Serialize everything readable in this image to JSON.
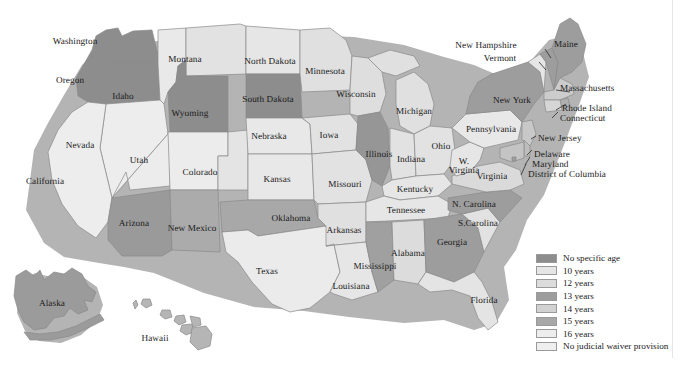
{
  "figure": {
    "type": "choropleth-map",
    "caption_partial": ""
  },
  "palette": {
    "no_specific_age": "#8d8d8d",
    "ten_years": "#e6e6e6",
    "twelve_years": "#dcdcdc",
    "thirteen_years": "#9d9d9d",
    "fourteen_years": "#d2d2d2",
    "fifteen_years": "#a8a8a8",
    "sixteen_years": "#ededed",
    "no_provision": "#efefef",
    "border": "#8a8a8a",
    "text": "#1a1a1a",
    "background": "#ffffff",
    "shadow": "#9b9b9b"
  },
  "legend": {
    "items": [
      {
        "label": "No specific age",
        "color": "#8d8d8d"
      },
      {
        "label": "10 years",
        "color": "#e6e6e6"
      },
      {
        "label": "12 years",
        "color": "#dcdcdc"
      },
      {
        "label": "13 years",
        "color": "#9d9d9d"
      },
      {
        "label": "14 years",
        "color": "#d2d2d2"
      },
      {
        "label": "15 years",
        "color": "#a8a8a8"
      },
      {
        "label": "16 years",
        "color": "#ededed"
      },
      {
        "label": "No judicial waiver provision",
        "color": "#efefef"
      }
    ]
  },
  "states": [
    {
      "name": "Washington",
      "label": "Washington",
      "x": 75,
      "y": 42,
      "fill": "#8d8d8d",
      "align": "ctr"
    },
    {
      "name": "Oregon",
      "label": "Oregon",
      "x": 70,
      "y": 81,
      "fill": "#8d8d8d",
      "align": "ctr"
    },
    {
      "name": "Idaho",
      "label": "Idaho",
      "x": 123,
      "y": 97,
      "fill": "#e9e9e9",
      "align": "ctr"
    },
    {
      "name": "Montana",
      "label": "Montana",
      "x": 185,
      "y": 60,
      "fill": "#e2e2e2",
      "align": "ctr"
    },
    {
      "name": "Wyoming",
      "label": "Wyoming",
      "x": 190,
      "y": 114,
      "fill": "#8d8d8d",
      "align": "ctr"
    },
    {
      "name": "Nevada",
      "label": "Nevada",
      "x": 80,
      "y": 146,
      "fill": "#ededed",
      "align": "ctr"
    },
    {
      "name": "California",
      "label": "California",
      "x": 45,
      "y": 182,
      "fill": "#ededed",
      "align": "ctr"
    },
    {
      "name": "Utah",
      "label": "Utah",
      "x": 139,
      "y": 161,
      "fill": "#ececec",
      "align": "ctr"
    },
    {
      "name": "Colorado",
      "label": "Colorado",
      "x": 200,
      "y": 173,
      "fill": "#e4e4e4",
      "align": "ctr"
    },
    {
      "name": "Arizona",
      "label": "Arizona",
      "x": 134,
      "y": 224,
      "fill": "#9a9a9a",
      "align": "ctr"
    },
    {
      "name": "New Mexico",
      "label": "New Mexico",
      "x": 192,
      "y": 229,
      "fill": "#ababab",
      "align": "ctr"
    },
    {
      "name": "North Dakota",
      "label": "North Dakota",
      "x": 270,
      "y": 62,
      "fill": "#e6e6e6",
      "align": "ctr"
    },
    {
      "name": "South Dakota",
      "label": "South Dakota",
      "x": 268,
      "y": 100,
      "fill": "#8d8d8d",
      "align": "ctr"
    },
    {
      "name": "Nebraska",
      "label": "Nebraska",
      "x": 269,
      "y": 137,
      "fill": "#e8e8e8",
      "align": "ctr"
    },
    {
      "name": "Kansas",
      "label": "Kansas",
      "x": 277,
      "y": 180,
      "fill": "#e8e8e8",
      "align": "ctr"
    },
    {
      "name": "Oklahoma",
      "label": "Oklahoma",
      "x": 291,
      "y": 219,
      "fill": "#a8a8a8",
      "align": "ctr"
    },
    {
      "name": "Texas",
      "label": "Texas",
      "x": 267,
      "y": 272,
      "fill": "#ebebeb",
      "align": "ctr"
    },
    {
      "name": "Minnesota",
      "label": "Minnesota",
      "x": 325,
      "y": 72,
      "fill": "#e0e0e0",
      "align": "ctr"
    },
    {
      "name": "Iowa",
      "label": "Iowa",
      "x": 329,
      "y": 136,
      "fill": "#e2e2e2",
      "align": "ctr"
    },
    {
      "name": "Missouri",
      "label": "Missouri",
      "x": 345,
      "y": 185,
      "fill": "#e2e2e2",
      "align": "ctr"
    },
    {
      "name": "Arkansas",
      "label": "Arkansas",
      "x": 344,
      "y": 231,
      "fill": "#e0e0e0",
      "align": "ctr"
    },
    {
      "name": "Louisiana",
      "label": "Louisiana",
      "x": 351,
      "y": 287,
      "fill": "#e6e6e6",
      "align": "ctr"
    },
    {
      "name": "Wisconsin",
      "label": "Wisconsin",
      "x": 356,
      "y": 95,
      "fill": "#dedede",
      "align": "ctr"
    },
    {
      "name": "Illinois",
      "label": "Illinois",
      "x": 379,
      "y": 155,
      "fill": "#969696",
      "align": "ctr"
    },
    {
      "name": "Michigan",
      "label": "Michigan",
      "x": 414,
      "y": 112,
      "fill": "#e0e0e0",
      "align": "ctr"
    },
    {
      "name": "Indiana",
      "label": "Indiana",
      "x": 411,
      "y": 160,
      "fill": "#e2e2e2",
      "align": "ctr"
    },
    {
      "name": "Ohio",
      "label": "Ohio",
      "x": 441,
      "y": 147,
      "fill": "#e2e2e2",
      "align": "ctr"
    },
    {
      "name": "Kentucky",
      "label": "Kentucky",
      "x": 415,
      "y": 190,
      "fill": "#e6e6e6",
      "align": "ctr"
    },
    {
      "name": "Tennessee",
      "label": "Tennessee",
      "x": 406,
      "y": 211,
      "fill": "#e6e6e6",
      "align": "ctr"
    },
    {
      "name": "Mississippi",
      "label": "Mississippi",
      "x": 375,
      "y": 267,
      "fill": "#a0a0a0",
      "align": "ctr"
    },
    {
      "name": "Alabama",
      "label": "Alabama",
      "x": 408,
      "y": 254,
      "fill": "#dcdcdc",
      "align": "ctr"
    },
    {
      "name": "Georgia",
      "label": "Georgia",
      "x": 452,
      "y": 243,
      "fill": "#9d9d9d",
      "align": "ctr"
    },
    {
      "name": "Florida",
      "label": "Florida",
      "x": 484,
      "y": 301,
      "fill": "#e4e4e4",
      "align": "ctr"
    },
    {
      "name": "South Carolina",
      "label": "S.Carolina",
      "x": 478,
      "y": 224,
      "fill": "#e2e2e2",
      "align": "ctr"
    },
    {
      "name": "North Carolina",
      "label": "N. Carolina",
      "x": 474,
      "y": 205,
      "fill": "#9d9d9d",
      "align": "ctr"
    },
    {
      "name": "West Virginia",
      "label": "W.\nVirginia",
      "x": 464,
      "y": 166,
      "fill": "#e6e6e6",
      "align": "ctr"
    },
    {
      "name": "Virginia",
      "label": "Virginia",
      "x": 492,
      "y": 177,
      "fill": "#dadada",
      "align": "ctr"
    },
    {
      "name": "Pennsylvania",
      "label": "Pennsylvania",
      "x": 491,
      "y": 130,
      "fill": "#e8e8e8",
      "align": "ctr"
    },
    {
      "name": "New York",
      "label": "New York",
      "x": 512,
      "y": 101,
      "fill": "#9d9d9d",
      "align": "ctr"
    },
    {
      "name": "Maine",
      "label": "Maine",
      "x": 566,
      "y": 45,
      "fill": "#9d9d9d",
      "align": "ctr"
    },
    {
      "name": "Alaska",
      "label": "Alaska",
      "x": 52,
      "y": 304,
      "fill": "#9b9b9b",
      "align": "ctr"
    },
    {
      "name": "Hawaii",
      "label": "Hawaii",
      "x": 155,
      "y": 339,
      "fill": "#b5b5b5",
      "align": "ctr"
    }
  ],
  "callouts": [
    {
      "name": "New Hampshire",
      "label": "New Hampshire",
      "x": 486,
      "y": 46
    },
    {
      "name": "Vermont",
      "label": "Vermont",
      "x": 500,
      "y": 59
    },
    {
      "name": "Massachusetts",
      "label": "Massachusetts",
      "x": 560,
      "y": 89
    },
    {
      "name": "Rhode Island",
      "label": "Rhode Island",
      "x": 562,
      "y": 109
    },
    {
      "name": "Connecticut",
      "label": "Connecticut",
      "x": 560,
      "y": 119
    },
    {
      "name": "New Jersey",
      "label": "New Jersey",
      "x": 538,
      "y": 139
    },
    {
      "name": "Delaware",
      "label": "Delaware",
      "x": 534,
      "y": 155
    },
    {
      "name": "Maryland",
      "label": "Maryland",
      "x": 532,
      "y": 165
    },
    {
      "name": "District of Columbia",
      "label": "District of Columbia",
      "x": 528,
      "y": 175
    }
  ]
}
